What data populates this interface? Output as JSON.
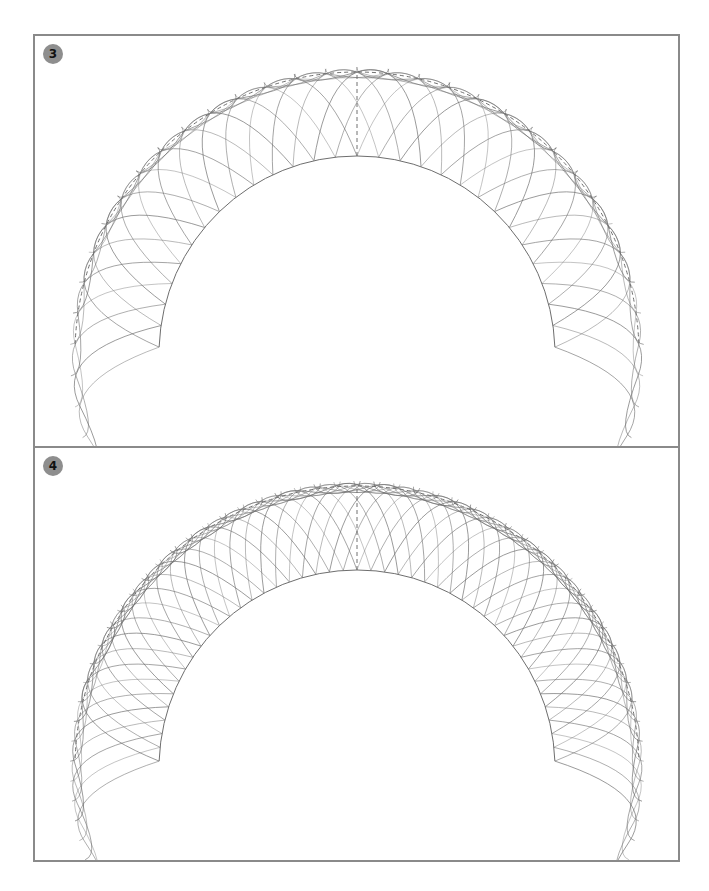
{
  "panels": [
    {
      "id": "panel-3",
      "badge": "3",
      "strands_per_side": 14,
      "strand_reach": 0.55,
      "construction": {
        "center": [
          322,
          318
        ],
        "inner_radius": 198,
        "outer_radius": 282,
        "outer_style": "dashed",
        "end_angle_deg": 2
      }
    },
    {
      "id": "panel-4",
      "badge": "4",
      "strands_per_side": 22,
      "strand_reach": 0.5,
      "construction": {
        "center": [
          322,
          320
        ],
        "inner_radius": 198,
        "outer_radius": 282,
        "outer_style": "dashed",
        "end_angle_deg": 2
      }
    }
  ],
  "colors": {
    "frame": "#8a8a8a",
    "badge_fill": "#8e8e8e",
    "badge_text": "#111111",
    "stroke": "#6e6e6e",
    "dash": "#707070"
  }
}
